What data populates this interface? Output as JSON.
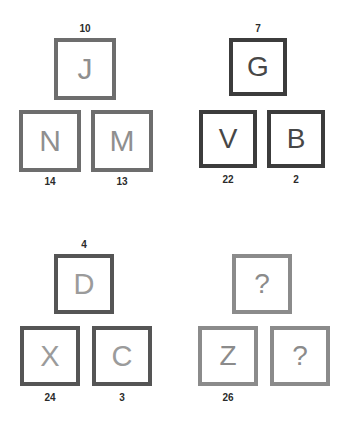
{
  "puzzle": {
    "type": "letter-tile-pyramid-analogy",
    "colors": {
      "background": "#ffffff",
      "group_a_border": "#6d6d6d",
      "group_a_letter": "#8f8f8f",
      "group_b_border": "#3c3c3c",
      "group_b_letter": "#474747",
      "group_c_border": "#555555",
      "group_c_letter": "#9b9b9b",
      "group_d_border": "#8b8b8b",
      "group_d_letter": "#8b8b8b",
      "number_label": "#2b2b2b"
    },
    "groups": [
      {
        "id": "top-left",
        "tiles": [
          {
            "position": "top",
            "letter": "J",
            "number": "10"
          },
          {
            "position": "bottom-left",
            "letter": "N",
            "number": "14"
          },
          {
            "position": "bottom-right",
            "letter": "M",
            "number": "13"
          }
        ]
      },
      {
        "id": "top-right",
        "tiles": [
          {
            "position": "top",
            "letter": "G",
            "number": "7"
          },
          {
            "position": "bottom-left",
            "letter": "V",
            "number": "22"
          },
          {
            "position": "bottom-right",
            "letter": "B",
            "number": "2"
          }
        ]
      },
      {
        "id": "bottom-left",
        "tiles": [
          {
            "position": "top",
            "letter": "D",
            "number": "4"
          },
          {
            "position": "bottom-left",
            "letter": "X",
            "number": "24"
          },
          {
            "position": "bottom-right",
            "letter": "C",
            "number": "3"
          }
        ]
      },
      {
        "id": "bottom-right",
        "tiles": [
          {
            "position": "top",
            "letter": "?",
            "number": ""
          },
          {
            "position": "bottom-left",
            "letter": "Z",
            "number": "26"
          },
          {
            "position": "bottom-right",
            "letter": "?",
            "number": ""
          }
        ]
      }
    ]
  }
}
